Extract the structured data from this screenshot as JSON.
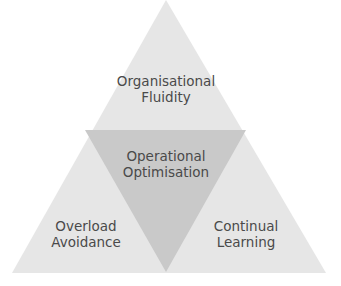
{
  "diagram": {
    "type": "triangle-subdivision",
    "colors": {
      "background": "#ffffff",
      "outer_fill": "#e6e6e6",
      "inner_fill": "#c9c9c9",
      "text": "#4a4a4a"
    },
    "sections": {
      "top": {
        "line1": "Organisational",
        "line2": "Fluidity"
      },
      "center": {
        "line1": "Operational",
        "line2": "Optimisation"
      },
      "bottom_left": {
        "line1": "Overload",
        "line2": "Avoidance"
      },
      "bottom_right": {
        "line1": "Continual",
        "line2": "Learning"
      }
    }
  }
}
